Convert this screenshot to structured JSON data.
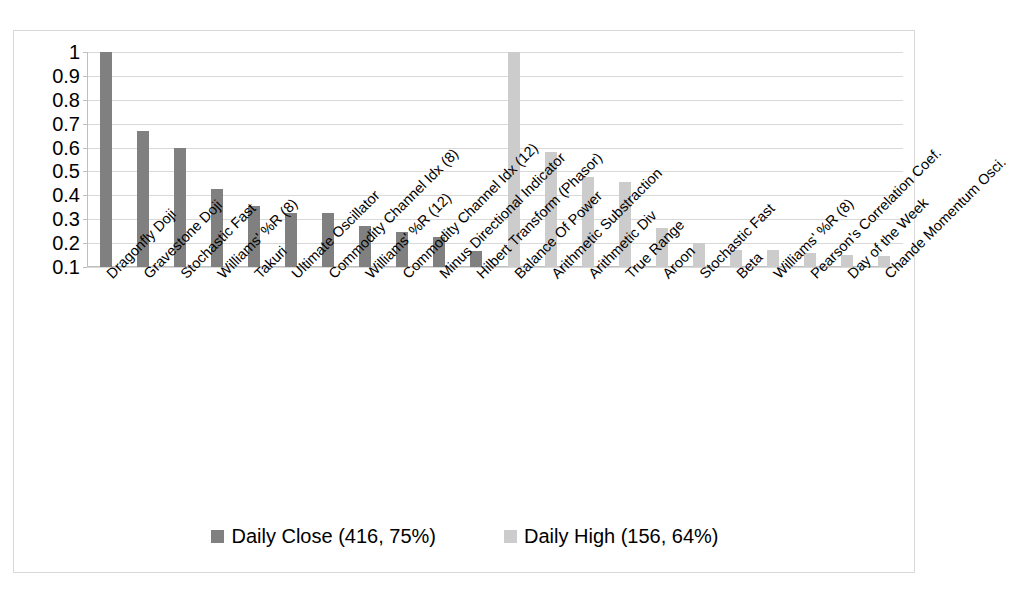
{
  "chart_data": {
    "type": "bar",
    "title": "",
    "subtitle": "",
    "xlabel": "",
    "ylabel": "",
    "grid": true,
    "legend_position": "bottom",
    "ylim": [
      0.1,
      1
    ],
    "y_ticks": [
      "1",
      "0.9",
      "0.8",
      "0.7",
      "0.6",
      "0.5",
      "0.4",
      "0.3",
      "0.2",
      "0.1"
    ],
    "y_tick_values": [
      1,
      0.9,
      0.8,
      0.7,
      0.6,
      0.5,
      0.4,
      0.3,
      0.2,
      0.1
    ],
    "categories": [
      "Dragonfly Doji",
      "Gravestone Doji",
      "Stochastic Fast",
      "Williams' %R (8)",
      "Takuri",
      "Ultimate Oscillator",
      "Commodity Channel Idx (8)",
      "Williams' %R (12)",
      "Commodity Channel Idx (12)",
      "Minus Directional Indicator",
      "Hilbert Transform (Phasor)",
      "Balance Of Power",
      "Arithmetic Substraction",
      "Arithmetic Div",
      "True Range",
      "Aroon",
      "Stochastic Fast",
      "Beta",
      "Williams' %R (8)",
      "Pearson's Correlation Coef.",
      "Day of the Week",
      "Chande Momentum Osci."
    ],
    "series": [
      {
        "name": "Daily Close (416, 75%)",
        "color": "#808080",
        "values": [
          1,
          0.67,
          0.6,
          0.425,
          0.355,
          0.325,
          0.325,
          0.27,
          0.245,
          0.225,
          0.165,
          null,
          null,
          null,
          null,
          null,
          null,
          null,
          null,
          null,
          null,
          null
        ]
      },
      {
        "name": "Daily High (156, 64%)",
        "color": "#cccccc",
        "values": [
          null,
          null,
          null,
          null,
          null,
          null,
          null,
          null,
          null,
          null,
          null,
          1,
          0.58,
          0.475,
          0.455,
          0.265,
          0.2,
          0.17,
          0.17,
          0.16,
          0.15,
          0.145
        ]
      }
    ],
    "legend": [
      {
        "label": "Daily Close (416, 75%)",
        "color": "#808080"
      },
      {
        "label": "Daily High (156, 64%)",
        "color": "#cccccc"
      }
    ]
  }
}
